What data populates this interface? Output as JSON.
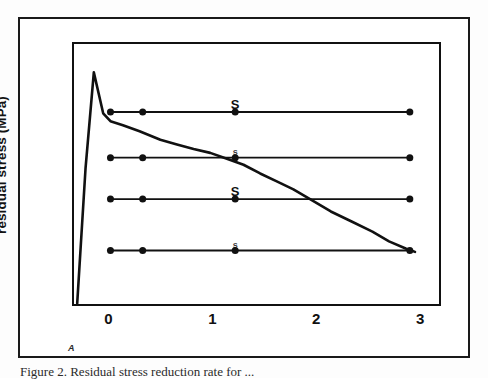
{
  "figure": {
    "caption": "Figure 2. Residual stress reduction rate for ...",
    "scan_artifact_mark": "A"
  },
  "chart_data": {
    "type": "line",
    "title": "",
    "xlabel": "",
    "ylabel": "residual stress (MPa)",
    "xlim": [
      -0.35,
      3.2
    ],
    "ylim": [
      0,
      10
    ],
    "xticks": [
      0,
      1,
      2,
      3
    ],
    "xtick_labels": [
      "0",
      "1",
      "2",
      "3"
    ],
    "yticks": [],
    "ytick_labels": [],
    "grid": false,
    "legend": "none",
    "line_color": "#111111",
    "marker_color": "#111111",
    "background": "#ffffff",
    "series": [
      {
        "name": "decay-curve",
        "kind": "curve",
        "markers": false,
        "x": [
          -0.3,
          -0.22,
          -0.14,
          -0.05,
          0.02,
          0.14,
          0.3,
          0.5,
          0.66,
          0.82,
          0.98,
          1.14,
          1.3,
          1.46,
          1.62,
          1.78,
          1.94,
          2.14,
          2.34,
          2.54,
          2.7,
          2.86,
          2.95
        ],
        "y": [
          0.1,
          5.2,
          8.85,
          7.3,
          7.0,
          6.85,
          6.62,
          6.3,
          6.12,
          5.95,
          5.8,
          5.58,
          5.35,
          5.02,
          4.72,
          4.42,
          4.05,
          3.58,
          3.2,
          2.82,
          2.45,
          2.18,
          2.05
        ]
      },
      {
        "name": "level-line-1",
        "kind": "line-with-markers",
        "markers": true,
        "x": [
          0.02,
          0.33,
          1.22,
          2.9
        ],
        "y": [
          7.35,
          7.35,
          7.35,
          7.35
        ],
        "annotation": "S",
        "annotation_x": 1.22
      },
      {
        "name": "level-line-2",
        "kind": "line-with-markers",
        "markers": true,
        "x": [
          0.02,
          0.33,
          1.22,
          2.9
        ],
        "y": [
          5.62,
          5.62,
          5.62,
          5.62
        ],
        "annotation": "s",
        "annotation_x": 1.22,
        "annotation_faint": true
      },
      {
        "name": "level-line-3",
        "kind": "line-with-markers",
        "markers": true,
        "x": [
          0.02,
          0.33,
          1.22,
          2.9
        ],
        "y": [
          4.05,
          4.05,
          4.05,
          4.05
        ],
        "annotation": "S",
        "annotation_x": 1.22
      },
      {
        "name": "level-line-4",
        "kind": "line-with-markers",
        "markers": true,
        "x": [
          0.02,
          0.33,
          1.22,
          2.9
        ],
        "y": [
          2.1,
          2.1,
          2.1,
          2.1
        ],
        "annotation": "s",
        "annotation_x": 1.22,
        "annotation_faint": true
      }
    ]
  }
}
